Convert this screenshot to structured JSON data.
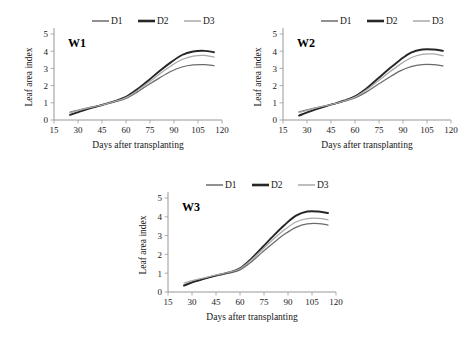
{
  "figure": {
    "panels": [
      "W1",
      "W2",
      "W3"
    ],
    "axis": {
      "xlabel": "Days after transplanting",
      "ylabel": "Leaf area index",
      "xticks": [
        "15",
        "30",
        "45",
        "60",
        "75",
        "90",
        "105",
        "120"
      ],
      "yticks": [
        "0",
        "1",
        "2",
        "3",
        "4",
        "5"
      ]
    },
    "legend": {
      "entries": [
        "D1",
        "D2",
        "D3"
      ]
    },
    "colors": {
      "d1": "#6b6b6b",
      "d2": "#262626",
      "d3": "#a8a8a8",
      "axis": "#8d8d8d",
      "text": "#151515"
    },
    "caption_fragment": ""
  },
  "chart_data": [
    {
      "type": "line",
      "title": "W1",
      "xlabel": "Days after transplanting",
      "ylabel": "Leaf area index",
      "xlim": [
        15,
        120
      ],
      "ylim": [
        0,
        5
      ],
      "xticks": [
        15,
        30,
        45,
        60,
        75,
        90,
        105,
        120
      ],
      "yticks": [
        0,
        1,
        2,
        3,
        4,
        5
      ],
      "grid": false,
      "legend_position": "top",
      "x": [
        25,
        32,
        39,
        46,
        53,
        60,
        67,
        74,
        81,
        88,
        95,
        102,
        109,
        115
      ],
      "series": [
        {
          "name": "D1",
          "color": "#6b6b6b",
          "values": [
            0.45,
            0.62,
            0.76,
            0.9,
            1.05,
            1.25,
            1.62,
            2.05,
            2.45,
            2.82,
            3.08,
            3.2,
            3.22,
            3.16
          ]
        },
        {
          "name": "D2",
          "color": "#262626",
          "values": [
            0.3,
            0.52,
            0.72,
            0.9,
            1.1,
            1.35,
            1.78,
            2.3,
            2.85,
            3.35,
            3.78,
            3.98,
            4.02,
            3.94
          ]
        },
        {
          "name": "D3",
          "color": "#a8a8a8",
          "values": [
            0.42,
            0.6,
            0.75,
            0.9,
            1.08,
            1.3,
            1.7,
            2.18,
            2.68,
            3.14,
            3.52,
            3.72,
            3.76,
            3.66
          ]
        }
      ]
    },
    {
      "type": "line",
      "title": "W2",
      "xlabel": "Days after transplanting",
      "ylabel": "Leaf area index",
      "xlim": [
        15,
        120
      ],
      "ylim": [
        0,
        5
      ],
      "xticks": [
        15,
        30,
        45,
        60,
        75,
        90,
        105,
        120
      ],
      "yticks": [
        0,
        1,
        2,
        3,
        4,
        5
      ],
      "grid": false,
      "legend_position": "top",
      "x": [
        25,
        32,
        39,
        46,
        53,
        60,
        67,
        74,
        81,
        88,
        95,
        102,
        109,
        115
      ],
      "series": [
        {
          "name": "D1",
          "color": "#6b6b6b",
          "values": [
            0.47,
            0.63,
            0.78,
            0.92,
            1.08,
            1.28,
            1.62,
            2.05,
            2.46,
            2.84,
            3.1,
            3.22,
            3.22,
            3.14
          ]
        },
        {
          "name": "D2",
          "color": "#262626",
          "values": [
            0.26,
            0.5,
            0.72,
            0.92,
            1.12,
            1.38,
            1.82,
            2.38,
            2.95,
            3.48,
            3.92,
            4.1,
            4.1,
            4.02
          ]
        },
        {
          "name": "D3",
          "color": "#a8a8a8",
          "values": [
            0.44,
            0.61,
            0.77,
            0.92,
            1.1,
            1.33,
            1.74,
            2.24,
            2.75,
            3.22,
            3.62,
            3.82,
            3.84,
            3.74
          ]
        }
      ]
    },
    {
      "type": "line",
      "title": "W3",
      "xlabel": "Days after transplanting",
      "ylabel": "Leaf area index",
      "xlim": [
        15,
        120
      ],
      "ylim": [
        0,
        5
      ],
      "xticks": [
        15,
        30,
        45,
        60,
        75,
        90,
        105,
        120
      ],
      "yticks": [
        0,
        1,
        2,
        3,
        4,
        5
      ],
      "grid": false,
      "legend_position": "top",
      "x": [
        25,
        32,
        39,
        46,
        53,
        60,
        67,
        74,
        81,
        88,
        95,
        102,
        109,
        115
      ],
      "series": [
        {
          "name": "D1",
          "color": "#6b6b6b",
          "values": [
            0.38,
            0.58,
            0.74,
            0.88,
            1.0,
            1.18,
            1.6,
            2.12,
            2.62,
            3.08,
            3.44,
            3.62,
            3.64,
            3.56
          ]
        },
        {
          "name": "D2",
          "color": "#262626",
          "values": [
            0.34,
            0.56,
            0.74,
            0.9,
            1.04,
            1.26,
            1.76,
            2.38,
            3.0,
            3.58,
            4.06,
            4.28,
            4.28,
            4.2
          ]
        },
        {
          "name": "D3",
          "color": "#a8a8a8",
          "values": [
            0.48,
            0.64,
            0.78,
            0.92,
            1.05,
            1.24,
            1.7,
            2.26,
            2.82,
            3.32,
            3.72,
            3.9,
            3.92,
            3.84
          ]
        }
      ]
    }
  ]
}
